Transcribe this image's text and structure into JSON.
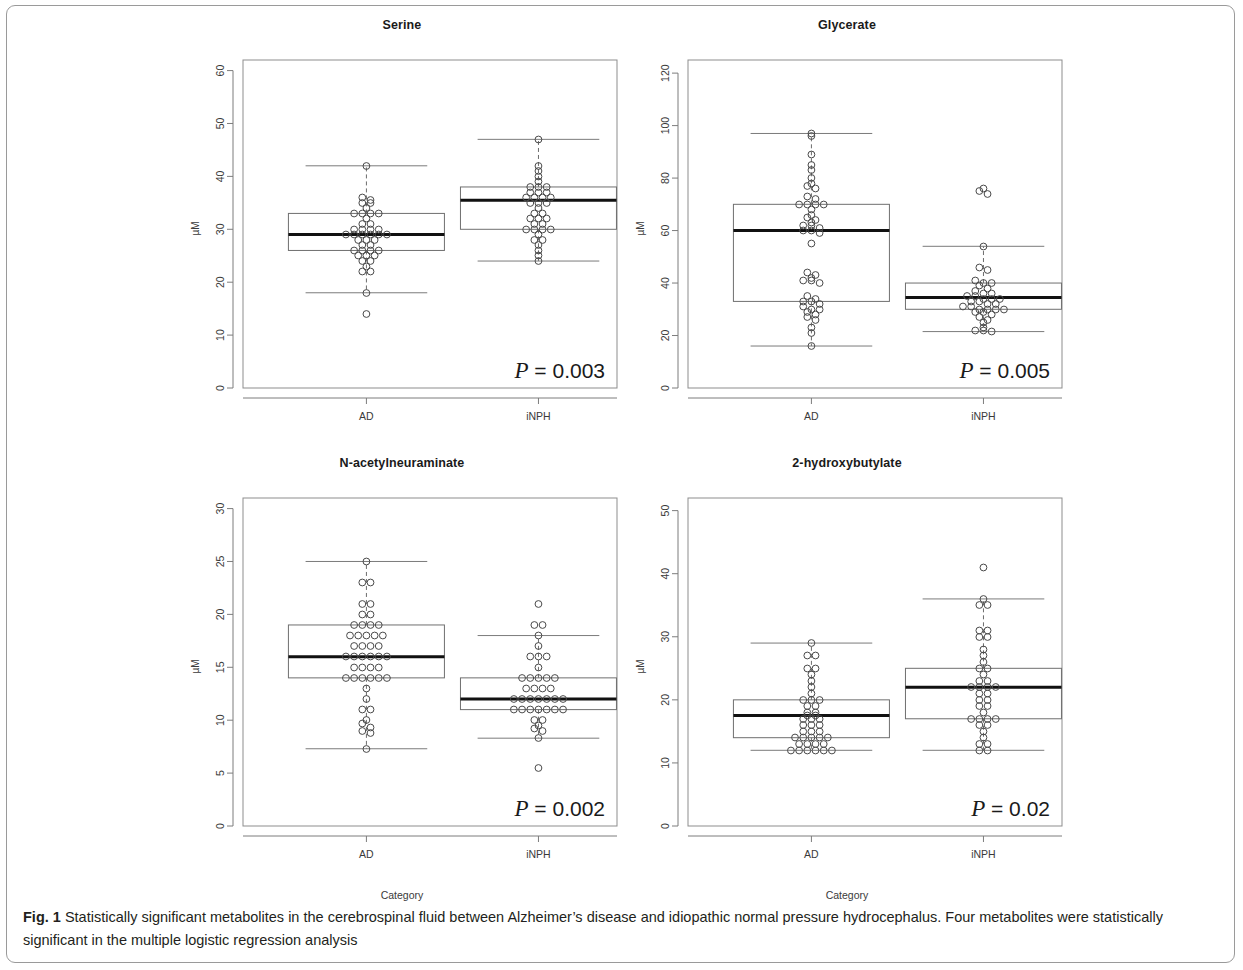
{
  "figure": {
    "caption_label": "Fig. 1",
    "caption_text": " Statistically significant metabolites in the cerebrospinal fluid between Alzheimer’s disease and idiopathic normal pressure hydrocephalus. Four metabolites were statistically significant in the multiple logistic regression analysis"
  },
  "chart_data": [
    {
      "type": "box",
      "title": "Serine",
      "ylabel": "µM",
      "xlabel": "",
      "categories": [
        "AD",
        "iNPH"
      ],
      "ylim": [
        0,
        62
      ],
      "yticks": [
        0,
        10,
        20,
        30,
        40,
        50,
        60
      ],
      "annotation": "P = 0.003",
      "pvalue": "0.003",
      "boxes": [
        {
          "name": "AD",
          "min": 18,
          "q1": 26,
          "median": 29,
          "q3": 33,
          "max": 42,
          "outliers": [
            14
          ]
        },
        {
          "name": "iNPH",
          "min": 24,
          "q1": 30,
          "median": 35.5,
          "q3": 38,
          "max": 47,
          "outliers": []
        }
      ],
      "points": {
        "AD": [
          42,
          36,
          35.5,
          35,
          35,
          34,
          33,
          33,
          33,
          33,
          32,
          31,
          31,
          30,
          30,
          30,
          30,
          29,
          29,
          29,
          29,
          29,
          29,
          28,
          28,
          28,
          27,
          27,
          26,
          26,
          26,
          26,
          25,
          25,
          25,
          24,
          24,
          23,
          22,
          22,
          18,
          14
        ],
        "iNPH": [
          47,
          42,
          41,
          40,
          39,
          38,
          38,
          38,
          37,
          37,
          37,
          36,
          36,
          36,
          36,
          35,
          35,
          35,
          34,
          33,
          33,
          32,
          32,
          32,
          31,
          31,
          30,
          30,
          30,
          30,
          29,
          28,
          28,
          27,
          26,
          25,
          24
        ]
      }
    },
    {
      "type": "box",
      "title": "Glycerate",
      "ylabel": "µM",
      "xlabel": "",
      "categories": [
        "AD",
        "iNPH"
      ],
      "ylim": [
        0,
        125
      ],
      "yticks": [
        0,
        20,
        40,
        60,
        80,
        100,
        120
      ],
      "annotation": "P = 0.005",
      "pvalue": "0.005",
      "boxes": [
        {
          "name": "AD",
          "min": 16,
          "q1": 33,
          "median": 60,
          "q3": 70,
          "max": 97,
          "outliers": []
        },
        {
          "name": "iNPH",
          "min": 21.5,
          "q1": 30,
          "median": 34.5,
          "q3": 40,
          "max": 54,
          "outliers": [
            74,
            75,
            76
          ]
        }
      ],
      "points": {
        "AD": [
          97,
          96,
          89,
          85,
          83,
          80,
          78,
          77,
          76,
          73,
          72,
          70,
          70,
          70,
          70,
          68,
          66,
          65,
          64,
          63,
          62,
          62,
          61,
          60,
          60,
          59,
          55,
          44,
          43,
          42,
          41,
          41,
          40,
          35,
          34,
          33,
          33,
          32,
          31,
          30,
          30,
          29,
          28,
          27,
          26,
          23,
          21,
          16
        ],
        "iNPH": [
          76,
          75,
          74,
          54,
          46,
          45,
          41,
          40,
          40,
          39,
          38,
          37,
          36,
          36,
          35,
          35,
          34,
          34,
          34,
          33,
          33,
          32,
          32,
          31,
          31,
          30,
          30,
          30,
          30,
          29,
          29,
          28,
          27,
          26,
          25,
          23,
          22,
          22,
          21.5
        ]
      }
    },
    {
      "type": "box",
      "title": "N-acetylneuraminate",
      "ylabel": "µM",
      "xlabel": "Category",
      "categories": [
        "AD",
        "iNPH"
      ],
      "ylim": [
        0,
        31
      ],
      "yticks": [
        0,
        5,
        10,
        15,
        20,
        25,
        30
      ],
      "annotation": "P = 0.002",
      "pvalue": "0.002",
      "boxes": [
        {
          "name": "AD",
          "min": 7.3,
          "q1": 14,
          "median": 16,
          "q3": 19,
          "max": 25,
          "outliers": []
        },
        {
          "name": "iNPH",
          "min": 8.3,
          "q1": 11,
          "median": 12,
          "q3": 14,
          "max": 18,
          "outliers": [
            5.5
          ]
        }
      ],
      "points": {
        "AD": [
          25,
          23,
          23,
          21,
          21,
          20,
          20,
          19,
          19,
          19,
          19,
          18,
          18,
          18,
          18,
          18,
          17,
          17,
          17,
          17,
          16,
          16,
          16,
          16,
          16,
          16,
          15,
          15,
          15,
          15,
          14,
          14,
          14,
          14,
          14,
          14,
          13,
          12,
          11,
          11,
          10,
          9.7,
          9.3,
          9,
          8.8,
          7.3
        ],
        "iNPH": [
          21,
          19,
          19,
          18,
          17,
          16,
          16,
          16,
          15,
          14,
          14,
          14,
          14,
          14,
          13,
          13,
          13,
          13,
          12,
          12,
          12,
          12,
          12,
          12,
          12,
          11,
          11,
          11,
          11,
          11,
          11,
          11,
          10,
          10,
          9.5,
          9.2,
          9,
          8.3,
          5.5
        ]
      }
    },
    {
      "type": "box",
      "title": "2-hydroxybutylate",
      "ylabel": "µM",
      "xlabel": "Category",
      "categories": [
        "AD",
        "iNPH"
      ],
      "ylim": [
        0,
        52
      ],
      "yticks": [
        0,
        10,
        20,
        30,
        40,
        50
      ],
      "annotation": "P = 0.02",
      "pvalue": "0.02",
      "boxes": [
        {
          "name": "AD",
          "min": 12,
          "q1": 14,
          "median": 17.5,
          "q3": 20,
          "max": 29,
          "outliers": []
        },
        {
          "name": "iNPH",
          "min": 12,
          "q1": 17,
          "median": 22,
          "q3": 25,
          "max": 36,
          "outliers": [
            41
          ]
        }
      ],
      "points": {
        "AD": [
          29,
          27,
          27,
          25,
          25,
          24,
          23,
          22,
          21,
          20,
          20,
          20,
          19,
          19,
          18,
          18,
          17.5,
          17.5,
          17,
          17,
          17,
          16,
          16,
          16,
          15,
          15,
          15,
          14,
          14,
          14,
          14,
          14,
          13,
          13,
          13,
          13,
          12,
          12,
          12,
          12,
          12,
          12
        ],
        "iNPH": [
          41,
          36,
          35,
          35,
          31,
          31,
          30,
          30,
          28,
          27,
          26,
          25,
          25,
          24,
          23,
          23,
          22,
          22,
          22,
          22,
          21,
          21,
          20,
          20,
          19,
          19,
          18,
          17,
          17,
          17,
          17,
          16,
          16,
          15,
          14,
          13,
          13,
          12,
          12
        ]
      }
    }
  ]
}
